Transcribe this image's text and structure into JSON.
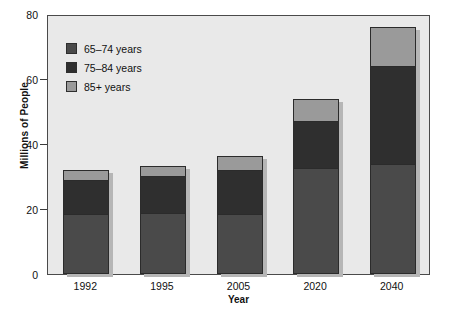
{
  "chart_data": {
    "type": "bar",
    "subtype": "stacked-bar",
    "title": "",
    "xlabel": "Year",
    "ylabel": "Millions of People",
    "categories": [
      "1992",
      "1995",
      "2005",
      "2020",
      "2040"
    ],
    "ylim": [
      0,
      80
    ],
    "yticks": [
      0,
      20,
      40,
      60,
      80
    ],
    "grid": false,
    "legend_position": "top-left inside plot",
    "series": [
      {
        "name": "65–74 years",
        "color": "#4a4a4a",
        "values": [
          18.5,
          18.7,
          18.6,
          32.5,
          34.0
        ]
      },
      {
        "name": "75–84 years",
        "color": "#2f2f2f",
        "values": [
          10.3,
          11.4,
          13.4,
          14.5,
          30.0
        ]
      },
      {
        "name": "85+ years",
        "color": "#9a9a9a",
        "values": [
          3.3,
          3.0,
          4.2,
          7.0,
          12.0
        ]
      }
    ],
    "totals": [
      32.1,
      33.1,
      36.2,
      54.0,
      76.0
    ]
  },
  "axes": {
    "y_label": "Millions of People",
    "x_label": "Year",
    "y_ticks": [
      {
        "value": 80,
        "label": "80"
      },
      {
        "value": 60,
        "label": "60"
      },
      {
        "value": 40,
        "label": "40"
      },
      {
        "value": 20,
        "label": "20"
      },
      {
        "value": 0,
        "label": "0"
      }
    ],
    "x_ticks": [
      {
        "label": "1992"
      },
      {
        "label": "1995"
      },
      {
        "label": "2005"
      },
      {
        "label": "2020"
      },
      {
        "label": "2040"
      }
    ]
  },
  "legend": {
    "items": [
      {
        "label": "65–74 years",
        "color": "#4a4a4a"
      },
      {
        "label": "75–84 years",
        "color": "#2f2f2f"
      },
      {
        "label": "85+ years",
        "color": "#9a9a9a"
      }
    ]
  },
  "colors": {
    "plot_background": "#e9e9e9",
    "plot_border": "#4a4a4a",
    "page_background": "#ffffff",
    "text": "#111111",
    "bar_outline": "#2b2b2b",
    "bar_shadow": "#b6b6b6"
  }
}
